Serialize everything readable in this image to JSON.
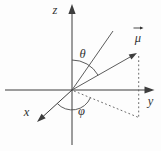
{
  "figure": {
    "type": "3d-coordinate-axes-with-vector",
    "background_color": "#fdfdfd",
    "line_color": "#3d3d3d",
    "labels": {
      "z_axis": "z",
      "y_axis": "y",
      "x_axis": "x",
      "polar_angle": "θ",
      "azimuthal_angle": "φ",
      "vector": "μ"
    },
    "elements": {
      "vector_has_overhead_arrow": true,
      "theta_between": "z-axis and mu vector",
      "phi_between": "x-axis and dashed projection in xy-plane",
      "dashed_lines": "projection of mu tip onto xy-plane"
    }
  }
}
